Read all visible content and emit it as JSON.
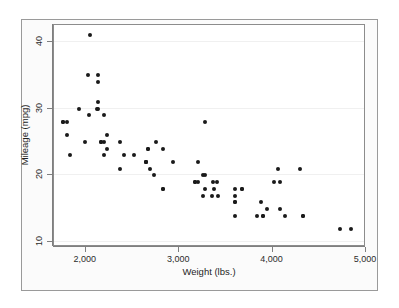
{
  "figure": {
    "background_color": "#ffffff",
    "frame_color": "#9a9a9a",
    "plot_background": "#ffffff",
    "marker_color": "#1a1a1a"
  },
  "chart_data": {
    "type": "scatter",
    "title": "",
    "subtitle": "",
    "xlabel": "Weight (lbs.)",
    "ylabel": "Mileage (mpg)",
    "xlim": [
      1660,
      5000
    ],
    "ylim": [
      9.3,
      42.5
    ],
    "xticks": [
      2000,
      3000,
      4000,
      5000
    ],
    "xtick_labels": [
      "2,000",
      "3,000",
      "4,000",
      "5,000"
    ],
    "yticks": [
      10,
      20,
      30,
      40
    ],
    "ytick_labels": [
      "10",
      "20",
      "30",
      "40"
    ],
    "grid": true,
    "grid_axis": "y",
    "legend": null,
    "legend_position": "none",
    "marker": "circle",
    "marker_size": 4,
    "series": [
      {
        "name": "Automobiles",
        "x": [
          2930,
          3350,
          2640,
          3250,
          4080,
          3670,
          2230,
          3280,
          3880,
          3400,
          4330,
          3900,
          4290,
          4080,
          3670,
          3200,
          4020,
          3280,
          3830,
          2200,
          2520,
          2130,
          1800,
          2230,
          2750,
          2130,
          2650,
          3250,
          4060,
          3600,
          3600,
          3600,
          3600,
          4840,
          2690,
          3940,
          4720,
          3200,
          3600,
          4130,
          2830,
          3370,
          2730,
          2130,
          2830,
          3280,
          3420,
          3360,
          4330,
          3900,
          2200,
          2670,
          2370,
          2020,
          2130,
          1800,
          1760,
          2050,
          2410,
          2200,
          1930,
          1990,
          3170,
          2670,
          2160,
          2370,
          2650,
          1760,
          2120,
          2160,
          2040,
          1830,
          3170,
          2830
        ],
        "y": [
          22,
          17,
          22,
          20,
          15,
          18,
          26,
          20,
          16,
          19,
          14,
          14,
          21,
          19,
          18,
          19,
          19,
          18,
          14,
          29,
          23,
          35,
          28,
          24,
          25,
          30,
          22,
          17,
          21,
          16,
          18,
          16,
          14,
          12,
          21,
          15,
          12,
          22,
          17,
          14,
          18,
          18,
          20,
          31,
          24,
          28,
          17,
          19,
          14,
          14,
          25,
          24,
          25,
          35,
          34,
          26,
          28,
          41,
          23,
          23,
          30,
          25,
          19,
          24,
          25,
          21,
          22,
          28,
          30,
          25,
          29,
          23,
          19,
          18
        ]
      }
    ]
  }
}
